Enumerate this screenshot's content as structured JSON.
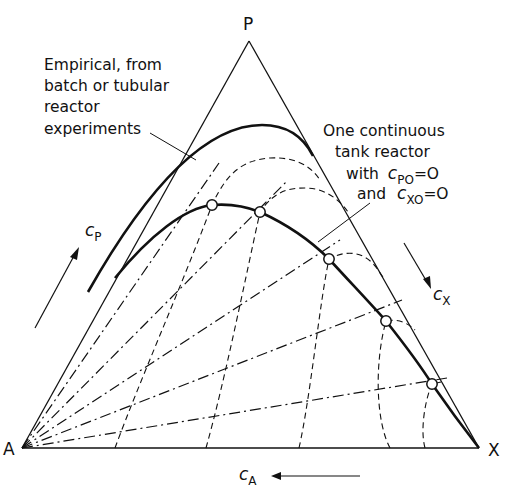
{
  "diagram": {
    "type": "ternary-composition-diagram",
    "vertices": {
      "top": "P",
      "bottom_left": "A",
      "bottom_right": "X"
    },
    "axis_labels": {
      "left": {
        "var": "c",
        "sub": "P"
      },
      "right": {
        "var": "c",
        "sub": "X"
      },
      "bottom": {
        "var": "c",
        "sub": "A"
      }
    },
    "annotations": {
      "empirical": [
        "Empirical, from",
        "batch or tubular",
        "reactor",
        "experiments"
      ],
      "cstr": {
        "line1": "One continuous",
        "line2": "tank reactor",
        "line3_prefix": "with",
        "line3_var": "c",
        "line3_sub": "PO",
        "line3_suffix": "=O",
        "line4_prefix": "and",
        "line4_var": "c",
        "line4_sub": "XO",
        "line4_suffix": "=O"
      }
    },
    "curves": [
      {
        "name": "empirical-curve",
        "style": "solid-heavy"
      },
      {
        "name": "cstr-curve",
        "style": "solid-heavy",
        "marked_points": 5
      },
      {
        "name": "dashed-trajectories",
        "style": "dashed"
      },
      {
        "name": "rays-from-A",
        "style": "dash-dot"
      }
    ],
    "colors": {
      "ink": "#111111",
      "background": "#ffffff"
    }
  }
}
